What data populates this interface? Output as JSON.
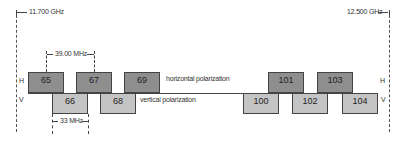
{
  "band": {
    "start_label": "11.700 GHz",
    "end_label": "12.500 GHz"
  },
  "dimensions": {
    "spacing_label": "39.00 MHz",
    "bandwidth_label": "33 MHz"
  },
  "polarization": {
    "h_letter": "H",
    "v_letter": "V",
    "horizontal_label": "horizontal polarization",
    "vertical_label": "vertical polarization"
  },
  "transponders": {
    "horizontal": [
      "65",
      "67",
      "69",
      "101",
      "103"
    ],
    "vertical": [
      "66",
      "68",
      "100",
      "102",
      "104"
    ]
  },
  "colors": {
    "horizontal_fill": "#8e8e8e",
    "vertical_fill": "#c4c4c4",
    "line": "#444444"
  }
}
